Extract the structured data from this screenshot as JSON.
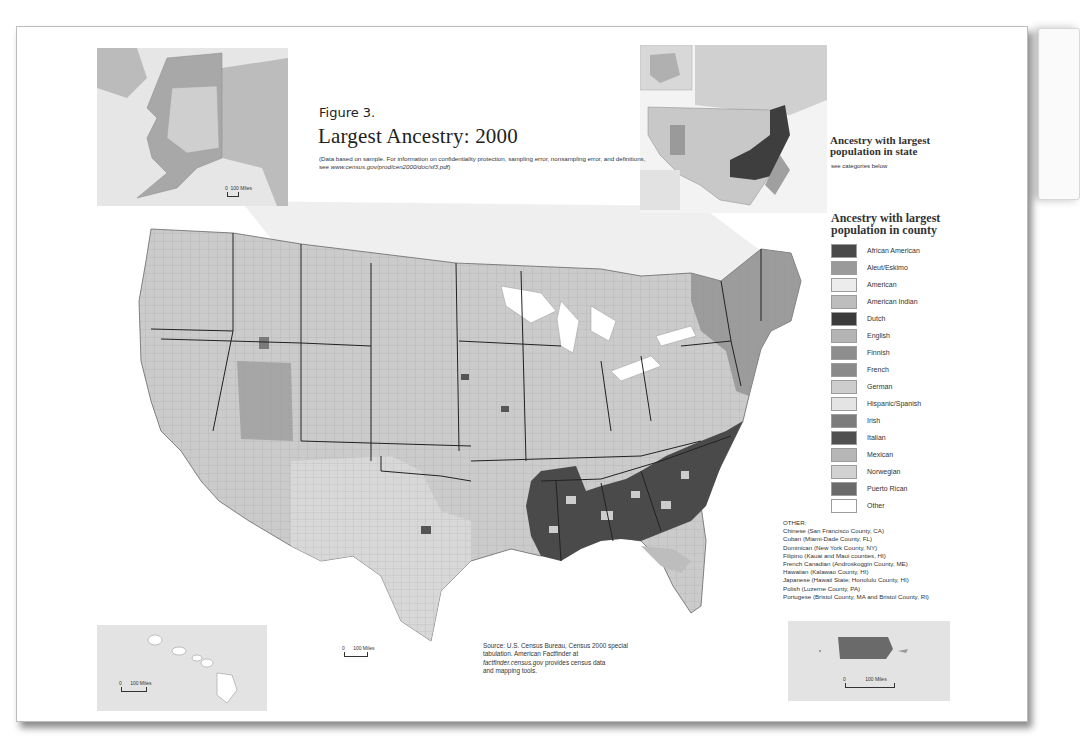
{
  "figure": {
    "label": "Figure 3.",
    "title": "Largest Ancestry: 2000",
    "note_prefix": "(Data based on sample. For information on confidentiality protection, sampling error, nonsampling error, and definitions, see ",
    "note_url": "www.census.gov/prod/cen2000/doc/sf3.pdf",
    "note_suffix": ")"
  },
  "state_legend": {
    "title_line1": "Ancestry with largest",
    "title_line2": "population in state",
    "subtitle": "see categories below"
  },
  "county_legend": {
    "title_line1": "Ancestry with largest",
    "title_line2": "population in county",
    "items": [
      {
        "label": "African American",
        "color": "#4a4a4a"
      },
      {
        "label": "Aleut/Eskimo",
        "color": "#9a9a9a"
      },
      {
        "label": "American",
        "color": "#ececec"
      },
      {
        "label": "American Indian",
        "color": "#bdbdbd"
      },
      {
        "label": "Dutch",
        "color": "#3c3c3c"
      },
      {
        "label": "English",
        "color": "#b4b4b4"
      },
      {
        "label": "Finnish",
        "color": "#8e8e8e"
      },
      {
        "label": "French",
        "color": "#8a8a8a"
      },
      {
        "label": "German",
        "color": "#cdcdcd"
      },
      {
        "label": "Hispanic/Spanish",
        "color": "#e4e4e4"
      },
      {
        "label": "Irish",
        "color": "#7c7c7c"
      },
      {
        "label": "Italian",
        "color": "#505050"
      },
      {
        "label": "Mexican",
        "color": "#b6b6b6"
      },
      {
        "label": "Norwegian",
        "color": "#d2d2d2"
      },
      {
        "label": "Puerto Rican",
        "color": "#6a6a6a"
      },
      {
        "label": "Other",
        "color": "#ffffff"
      }
    ]
  },
  "other": {
    "heading": "OTHER:",
    "items": [
      "Chinese (San Francisco County, CA)",
      "Cuban (Miami-Dade County, FL)",
      "Dominican (New York County, NY)",
      "Filipino (Kauai and Maui counties, HI)",
      "French Canadian (Androskoggin County, ME)",
      "Hawaiian (Kalawao County, HI)",
      "Japanese (Hawaii State; Honolulu County, HI)",
      "Polish (Luzerne County, PA)",
      "Portugese (Bristol County, MA and Bristol County, RI)"
    ]
  },
  "source": {
    "line1": "Source: U.S. Census Bureau, Census 2000 special",
    "line2": "tabulation. American Factfinder at",
    "url": "factfinder.census.gov",
    "line3_suffix": " provides census data",
    "line4": "and mapping tools."
  },
  "scales": {
    "alaska": {
      "zero": "0",
      "label": "100 Miles"
    },
    "hawaii": {
      "zero": "0",
      "label": "100 Miles"
    },
    "main": {
      "zero": "0",
      "label": "100 Miles"
    },
    "puerto_rico": {
      "zero": "0",
      "label": "100 Miles"
    }
  },
  "colors": {
    "map_base": "#c9c9c9",
    "african_american": "#4a4a4a",
    "german": "#cdcdcd",
    "inset_bg": "#e3e3e3"
  }
}
